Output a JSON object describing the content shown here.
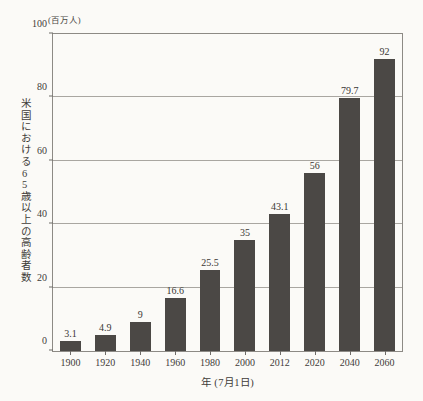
{
  "chart_data": {
    "type": "bar",
    "title": "",
    "subtitle": "",
    "unit_label": "(百万人)",
    "xlabel": "年 (7月1日)",
    "ylabel": "米国における65歳以上の高齢者数",
    "categories": [
      "1900",
      "1920",
      "1940",
      "1960",
      "1980",
      "2000",
      "2012",
      "2020",
      "2040",
      "2060"
    ],
    "values": [
      3.1,
      4.9,
      9,
      16.6,
      25.5,
      35,
      43.1,
      56,
      79.7,
      92
    ],
    "value_labels": [
      "3.1",
      "4.9",
      "9",
      "16.6",
      "25.5",
      "35",
      "43.1",
      "56",
      "79.7",
      "92"
    ],
    "ylim": [
      0,
      100
    ],
    "yticks": [
      0,
      20,
      40,
      60,
      80,
      100
    ],
    "ytick_labels": [
      "0",
      "20",
      "40",
      "60",
      "80",
      "100"
    ],
    "grid": true,
    "grid_axis": "y",
    "legend": "none",
    "bar_color": "#4b4845",
    "grid_color": "#a9a6a1",
    "frame_color": "#8d8a85",
    "background_color": "#fbfaf7",
    "text_color": "#3f3c39"
  }
}
